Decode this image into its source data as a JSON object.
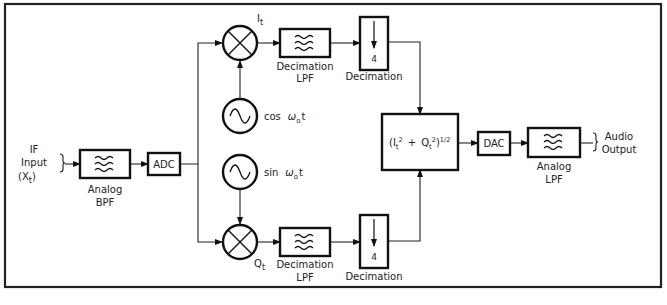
{
  "diagram": {
    "type": "block-diagram",
    "input": {
      "label_line1": "IF",
      "label_line2": "Input",
      "label_line3_prefix": "(X",
      "label_line3_sub": "t",
      "label_line3_suffix": ")"
    },
    "blocks": {
      "analog_bpf": {
        "line1": "Analog",
        "line2": "BPF",
        "icon": "filter-waves-icon"
      },
      "adc": {
        "label": "ADC"
      },
      "mixer_i": {
        "icon": "multiplier-icon",
        "out_label": "I",
        "out_sub": "t"
      },
      "mixer_q": {
        "icon": "multiplier-icon",
        "out_label": "Q",
        "out_sub": "t"
      },
      "osc_cos": {
        "icon": "sine-oscillator-icon",
        "label_fn": "cos",
        "label_omega": "ω",
        "label_sub": "o",
        "label_t": "t"
      },
      "osc_sin": {
        "icon": "sine-oscillator-icon",
        "label_fn": "sin",
        "label_omega": "ω",
        "label_sub": "o",
        "label_t": "t"
      },
      "dec_lpf_top": {
        "line1": "Decimation",
        "line2": "LPF",
        "icon": "filter-waves-icon"
      },
      "dec_lpf_bottom": {
        "line1": "Decimation",
        "line2": "LPF",
        "icon": "filter-waves-icon"
      },
      "decim_top": {
        "factor": "4",
        "label": "Decimation",
        "icon": "down-arrow-icon"
      },
      "decim_bottom": {
        "factor": "4",
        "label": "Decimation",
        "icon": "down-arrow-icon"
      },
      "magnitude": {
        "open": "(I",
        "i_sub": "t",
        "sq1": "2",
        "plus": "+",
        "q": "Q",
        "q_sub": "t",
        "sq2": "2",
        "close": ")",
        "exp": "1/2"
      },
      "dac": {
        "label": "DAC"
      },
      "analog_lpf": {
        "line1": "Analog",
        "line2": "LPF",
        "icon": "filter-waves-icon"
      }
    },
    "output": {
      "line1": "Audio",
      "line2": "Output"
    },
    "colors": {
      "stroke": "#111111",
      "background": "#ffffff",
      "text": "#222222"
    }
  }
}
